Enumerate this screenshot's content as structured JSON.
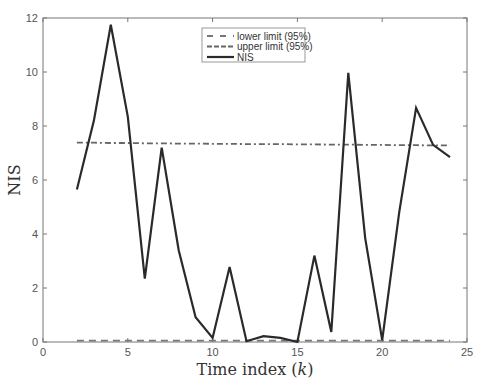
{
  "chart_data": {
    "type": "line",
    "title": "",
    "xlabel": "Time index (k)",
    "ylabel": "NIS",
    "xlim": [
      0,
      25
    ],
    "ylim": [
      0,
      12
    ],
    "xticks": [
      0,
      5,
      10,
      15,
      20,
      25
    ],
    "yticks": [
      0,
      2,
      4,
      6,
      8,
      10,
      12
    ],
    "grid": false,
    "legend_position": "upper center",
    "x": [
      2,
      3,
      4,
      5,
      6,
      7,
      8,
      9,
      10,
      11,
      12,
      13,
      14,
      15,
      16,
      17,
      18,
      19,
      20,
      21,
      22,
      23,
      24
    ],
    "series": [
      {
        "name": "lower limit (95%)",
        "style": "dashed",
        "color": "#777777",
        "values": [
          0.05,
          0.05,
          0.05,
          0.05,
          0.05,
          0.05,
          0.05,
          0.05,
          0.05,
          0.05,
          0.05,
          0.05,
          0.05,
          0.05,
          0.05,
          0.05,
          0.05,
          0.05,
          0.05,
          0.05,
          0.05,
          0.05,
          0.05
        ]
      },
      {
        "name": "upper limit (95%)",
        "style": "dashdot",
        "color": "#666666",
        "values": [
          7.38,
          7.38,
          7.37,
          7.37,
          7.36,
          7.36,
          7.35,
          7.35,
          7.34,
          7.34,
          7.33,
          7.33,
          7.33,
          7.32,
          7.32,
          7.31,
          7.31,
          7.3,
          7.3,
          7.29,
          7.29,
          7.28,
          7.28
        ]
      },
      {
        "name": "NIS",
        "style": "solid",
        "color": "#2a2a2a",
        "values": [
          5.65,
          8.2,
          11.75,
          8.35,
          2.35,
          7.2,
          3.4,
          0.92,
          0.15,
          2.78,
          0.03,
          0.22,
          0.15,
          0.0,
          3.2,
          0.37,
          9.97,
          3.85,
          0.07,
          4.8,
          8.67,
          7.3,
          6.85
        ]
      }
    ]
  }
}
